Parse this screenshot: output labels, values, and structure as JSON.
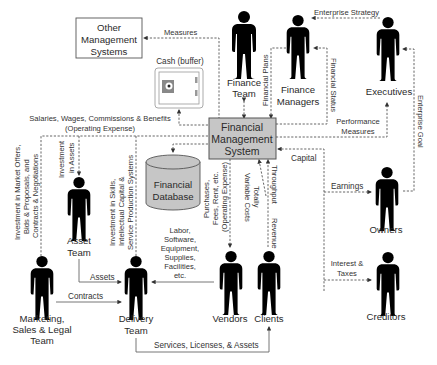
{
  "diagram": {
    "center": {
      "label_lines": [
        "Financial",
        "Management",
        "System"
      ],
      "fill": "#c6c6c6"
    },
    "database": {
      "label_lines": [
        "Financial",
        "Database"
      ],
      "fill": "#c6c6c6"
    },
    "cash": {
      "label": "Cash (buffer)"
    },
    "other_systems": {
      "label_lines": [
        "Other",
        "Management",
        "Systems"
      ]
    },
    "actors": {
      "finance_team": [
        "Finance",
        "Team"
      ],
      "finance_managers": [
        "Finance",
        "Managers"
      ],
      "executives": [
        "Executives"
      ],
      "owners": [
        "Owners"
      ],
      "creditors": [
        "Creditors"
      ],
      "asset_team": [
        "Asset",
        "Team"
      ],
      "marketing": [
        "Marketing,",
        "Sales & Legal",
        "Team"
      ],
      "delivery": [
        "Delivery",
        "Team"
      ],
      "vendors": [
        "Vendors"
      ],
      "clients": [
        "Clients"
      ]
    },
    "flows": {
      "measures": "Measures",
      "enterprise_strategy": "Enterprise Strategy",
      "financial_plans": "Financial Plans",
      "financial_status": "Financial Status",
      "enterprise_goal": "Enterprise Goal",
      "performance_measures": [
        "Performance",
        "Measures"
      ],
      "salaries": [
        "Salaries, Wages, Commissions & Benefits",
        "(Operating Expense)"
      ],
      "capital": "Capital",
      "earnings": "Earnings",
      "interest_taxes": [
        "Interest &",
        "Taxes"
      ],
      "investment_market": [
        "Investment in Market Offers,",
        "Bids & Proposals, and",
        "Contracts & Negotiations"
      ],
      "investment_assets": [
        "Investment",
        "in Assets"
      ],
      "investment_skills": [
        "Investment in Skills,",
        "Intellectual Capital &",
        "Service Production Systems"
      ],
      "purchases": [
        "Purchases,",
        "Fees, Rent, etc.",
        "(Operating Expense)"
      ],
      "variable_costs": [
        "Totally",
        "Variable Costs"
      ],
      "throughput": "Throughput",
      "revenue": "Revenue",
      "labor": [
        "Labor,",
        "Software,",
        "Equipment,",
        "Supplies,",
        "Facilities,",
        "etc."
      ],
      "assets": "Assets",
      "contracts": "Contracts",
      "services": "Services, Licenses, & Assets"
    }
  }
}
